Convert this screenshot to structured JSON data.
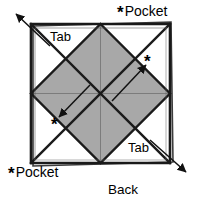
{
  "figure": {
    "caption": "Back",
    "colors": {
      "shaded_fill": "#a8a8a8",
      "paper_fill": "#ffffff",
      "outline": "#1a1a1a",
      "fold_line": "#6e6e6e",
      "arrow": "#111111"
    },
    "square": {
      "left": 31,
      "top": 24,
      "right": 170,
      "bottom": 163
    },
    "labels": {
      "tab_top_left": "Tab",
      "tab_bottom_right": "Tab",
      "pocket_top_right": "Pocket",
      "pocket_bottom_left": "Pocket",
      "back": "Back",
      "star": "*"
    },
    "markers": [
      {
        "name": "star-top-right-inner",
        "symbol": "*",
        "x": 146,
        "y": 55
      },
      {
        "name": "star-bottom-left-inner",
        "symbol": "*",
        "x": 53,
        "y": 118
      }
    ],
    "arrows": [
      {
        "name": "arrow-top-left-out",
        "direction": "up-left",
        "from": [
          48,
          44
        ],
        "to": [
          16,
          14
        ]
      },
      {
        "name": "arrow-bottom-right-out",
        "direction": "down-right",
        "from": [
          152,
          142
        ],
        "to": [
          186,
          172
        ]
      },
      {
        "name": "arrow-center-to-upper-right",
        "direction": "up-right",
        "from": [
          112,
          100
        ],
        "to": [
          145,
          64
        ]
      },
      {
        "name": "arrow-center-to-lower-left",
        "direction": "down-left",
        "from": [
          88,
          86
        ],
        "to": [
          60,
          116
        ]
      }
    ]
  }
}
